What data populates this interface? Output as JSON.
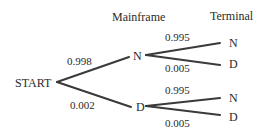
{
  "headers": {
    "mainframe": "Mainframe",
    "terminal": "Terminal"
  },
  "root": {
    "label": "START"
  },
  "level1": [
    {
      "label": "N",
      "prob": "0.998"
    },
    {
      "label": "D",
      "prob": "0.002"
    }
  ],
  "level2": {
    "from_N": [
      {
        "label": "N",
        "prob": "0.995"
      },
      {
        "label": "D",
        "prob": "0.005"
      }
    ],
    "from_D": [
      {
        "label": "N",
        "prob": "0.995"
      },
      {
        "label": "D",
        "prob": "0.005"
      }
    ]
  },
  "colors": {
    "line": "#3a3a3a",
    "text": "#2a2a2a",
    "background": "#ffffff"
  }
}
